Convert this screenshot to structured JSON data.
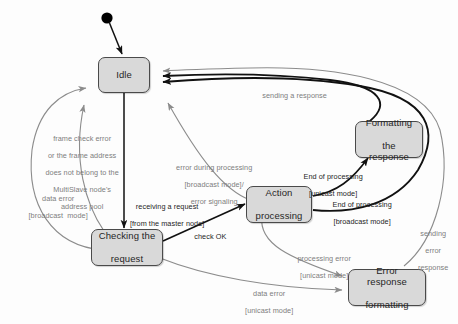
{
  "diagram": {
    "background_color": "#fdfdfd",
    "state_fill": "#d9d9d9",
    "state_stroke": "#4a4a4a",
    "gray_edge_color": "#8c8c8c",
    "black_edge_color": "#111111",
    "start_node_color": "#000000"
  },
  "states": [
    {
      "id": "idle",
      "label": "Idle"
    },
    {
      "id": "formatting",
      "label": "Formatting\nthe response",
      "line1": "Formatting",
      "line2": "the response"
    },
    {
      "id": "action",
      "label": "Action\nprocessing",
      "line1": "Action",
      "line2": "processing"
    },
    {
      "id": "checking",
      "label": "Checking the\nrequest",
      "line1": "Checking the",
      "line2": "request"
    },
    {
      "id": "errorfmt",
      "label": "Error response\nformatting",
      "line1": "Error response",
      "line2": "formatting"
    }
  ],
  "transition_labels": {
    "start": "",
    "sending_a_response": "sending a response",
    "frame_check_error": "frame check error\nor the frame address\ndoes not belong to the\nMultiSlave node's\naddress pool",
    "frame_check_error_lines": [
      "frame check error",
      "or the frame address",
      "does not belong to the",
      "MultiSlave node's",
      "address pool"
    ],
    "data_error_broadcast": "data error\n[broadcast  mode]",
    "data_error_broadcast_lines": [
      "data error",
      "[broadcast  mode]"
    ],
    "receiving_a_request": "receiving a request\n[from the master node]",
    "receiving_a_request_lines": [
      "receiving a request",
      "[from the master node]"
    ],
    "error_during_processing": "error during processing\n[broadcast mode]/\nerror signaling",
    "error_during_processing_lines": [
      "error during processing",
      "[broadcast mode]/",
      "error signaling"
    ],
    "check_ok": "check OK",
    "end_of_processing_unicast": "End of processing\n[unicast mode]",
    "end_of_processing_unicast_lines": [
      "End of processing",
      "[unicast mode]"
    ],
    "end_of_processing_broadcast": "End of processing\n[broadcast mode]",
    "end_of_processing_broadcast_lines": [
      "End of processing",
      "[broadcast mode]"
    ],
    "processing_error_unicast": "processing error\n[unicast mode]",
    "processing_error_unicast_lines": [
      "processing error",
      "[unicast mode]"
    ],
    "sending_error_response": "sending\nerror\nresponse",
    "sending_error_response_lines": [
      "sending",
      "error",
      "response"
    ],
    "data_error_unicast": "data error\n[unicast mode]",
    "data_error_unicast_lines": [
      "data error",
      "[unicast mode]"
    ]
  }
}
